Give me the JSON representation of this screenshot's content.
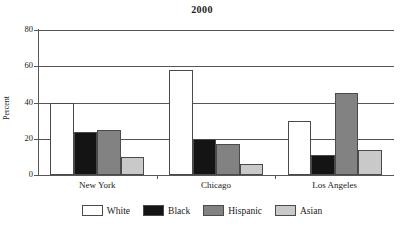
{
  "chart_data": {
    "type": "bar",
    "title": "2000",
    "xlabel": "",
    "ylabel": "Percent",
    "ylim": [
      0,
      80
    ],
    "yticks": [
      0,
      20,
      40,
      60,
      80
    ],
    "grid": true,
    "legend_position": "bottom",
    "categories": [
      "New York",
      "Chicago",
      "Los Angeles"
    ],
    "series": [
      {
        "name": "White",
        "color": "#ffffff",
        "values": [
          40,
          58,
          30
        ]
      },
      {
        "name": "Black",
        "color": "#141414",
        "values": [
          24,
          20,
          11
        ]
      },
      {
        "name": "Hispanic",
        "color": "#828282",
        "values": [
          25,
          17,
          45
        ]
      },
      {
        "name": "Asian",
        "color": "#c9c9c9",
        "values": [
          10,
          6,
          14
        ]
      }
    ]
  },
  "axis": {
    "tick_labels": [
      "0",
      "20",
      "40",
      "60",
      "80"
    ]
  }
}
